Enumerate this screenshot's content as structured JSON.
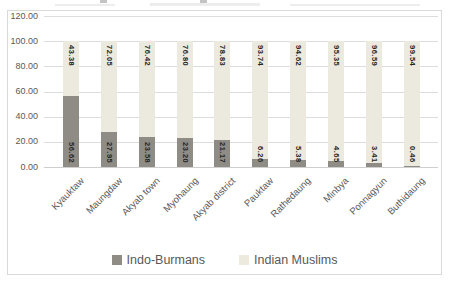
{
  "chart_data": {
    "type": "bar",
    "stacked": true,
    "orientation": "vertical",
    "title": "",
    "xlabel": "",
    "ylabel": "",
    "categories": [
      "Kyauktaw",
      "Maungdaw",
      "Akyab town",
      "Myohaung",
      "Akyab district",
      "Pauktaw",
      "Rathedaung",
      "Minbya",
      "Ponnagyun",
      "Buthidaung"
    ],
    "series": [
      {
        "name": "Indo-Burmans",
        "color": "#8e8c85",
        "values": [
          56.62,
          27.95,
          23.58,
          23.2,
          21.17,
          6.26,
          5.38,
          4.65,
          3.41,
          0.46
        ],
        "labels": [
          "56.62",
          "27.95",
          "23.58",
          "23.20",
          "21.17",
          "6.26",
          "5.38",
          "4.65",
          "3.41",
          "0.46"
        ],
        "label_position": "inside-base"
      },
      {
        "name": "Indian Muslims",
        "color": "#eceadf",
        "values": [
          43.38,
          72.05,
          76.42,
          76.8,
          78.83,
          93.74,
          94.62,
          95.35,
          96.59,
          99.54
        ],
        "labels": [
          "43.38",
          "72.05",
          "76.42",
          "76.80",
          "78.83",
          "93.74",
          "94.62",
          "95.35",
          "96.59",
          "99.54"
        ],
        "label_position": "inside-end"
      }
    ],
    "ylim": [
      0,
      120
    ],
    "y_ticks": [
      {
        "value": 0,
        "label": "0.00"
      },
      {
        "value": 20,
        "label": "20.00"
      },
      {
        "value": 40,
        "label": "40.00"
      },
      {
        "value": 60,
        "label": "60.00"
      },
      {
        "value": 80,
        "label": "80.00"
      },
      {
        "value": 100,
        "label": "100.00"
      },
      {
        "value": 120,
        "label": "120.00"
      }
    ],
    "grid": true,
    "legend": {
      "position": "bottom",
      "entries": [
        "Indo-Burmans",
        "Indian Muslims"
      ]
    },
    "data_label_rotation": 90,
    "category_label_rotation": -45
  },
  "colors": {
    "background": "#ffffff",
    "frame_border": "#d9d9d9",
    "gridline": "#dcdcdc",
    "axis_text": "#595959",
    "data_label_text": "#262626",
    "series_dark": "#8e8c85",
    "series_light": "#eceadf"
  }
}
